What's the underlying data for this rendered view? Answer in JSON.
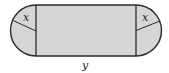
{
  "diagram": {
    "shape": {
      "fill": "#d6d6d6",
      "stroke": "#2a2a2a",
      "rect": {
        "x": 36,
        "y": 5,
        "width": 100,
        "height": 51
      },
      "radius": 25.5
    },
    "labels": {
      "left_radius": "x",
      "right_radius": "x",
      "rect_length": "y"
    }
  }
}
